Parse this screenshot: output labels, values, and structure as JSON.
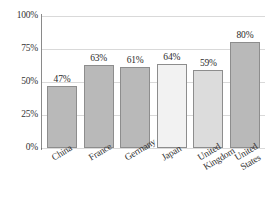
{
  "chart_data": {
    "type": "bar",
    "title": "",
    "subtitle": "",
    "xlabel": "",
    "ylabel": "",
    "categories": [
      "China",
      "France",
      "Germany",
      "Japan",
      "United Kingdom",
      "United States"
    ],
    "category_display": [
      "China",
      "France",
      "Germany",
      "Japan",
      "United\nKingdom",
      "United\nStates"
    ],
    "values": [
      47,
      63,
      61,
      64,
      59,
      80
    ],
    "value_labels": [
      "47%",
      "63%",
      "61%",
      "64%",
      "59%",
      "80%"
    ],
    "bar_colors": [
      "#b9b9b9",
      "#b9b9b9",
      "#b9b9b9",
      "#f2f2f2",
      "#dcdcdc",
      "#b9b9b9"
    ],
    "bar_border_color": "#8d8d8d",
    "ylim": [
      0,
      100
    ],
    "yticks": [
      0,
      25,
      50,
      75,
      100
    ],
    "ytick_labels": [
      "0%",
      "25%",
      "50%",
      "75%",
      "100%"
    ],
    "grid": true,
    "gridline_color": "#d9d9d9",
    "axis_color": "#6f6f6f",
    "legend": null,
    "legend_position": "none",
    "background": "#ffffff"
  }
}
